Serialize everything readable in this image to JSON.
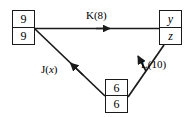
{
  "diagram": {
    "type": "directed-graph",
    "background_color": "#ffffff",
    "stroke_color": "#1a1a1a",
    "text_color": "#000000",
    "nodes": [
      {
        "id": "left",
        "position": "top-left",
        "cells": [
          {
            "value": "9",
            "style": "plain"
          },
          {
            "value": "9",
            "style": "plain"
          }
        ]
      },
      {
        "id": "right",
        "position": "top-right",
        "cells": [
          {
            "value": "y",
            "style": "italic"
          },
          {
            "value": "z",
            "style": "italic"
          }
        ]
      },
      {
        "id": "bottom",
        "position": "bottom-center",
        "cells": [
          {
            "value": "6",
            "style": "plain"
          },
          {
            "value": "6",
            "style": "plain"
          }
        ]
      }
    ],
    "edges": [
      {
        "id": "k",
        "label_name": "K",
        "label_arg": "8",
        "label_text": "K(8)",
        "from": "left",
        "to": "right",
        "arrow_direction": "right"
      },
      {
        "id": "j",
        "label_name": "J",
        "label_arg": "x",
        "label_arg_style": "italic",
        "label_prefix": "J(",
        "label_suffix": ")",
        "from": "bottom",
        "to": "left",
        "arrow_direction": "up-left"
      },
      {
        "id": "l",
        "label_name": "L",
        "label_arg": "10",
        "label_text": "L(10)",
        "from": "bottom",
        "to": "right",
        "arrow_direction": "up-right"
      }
    ]
  }
}
